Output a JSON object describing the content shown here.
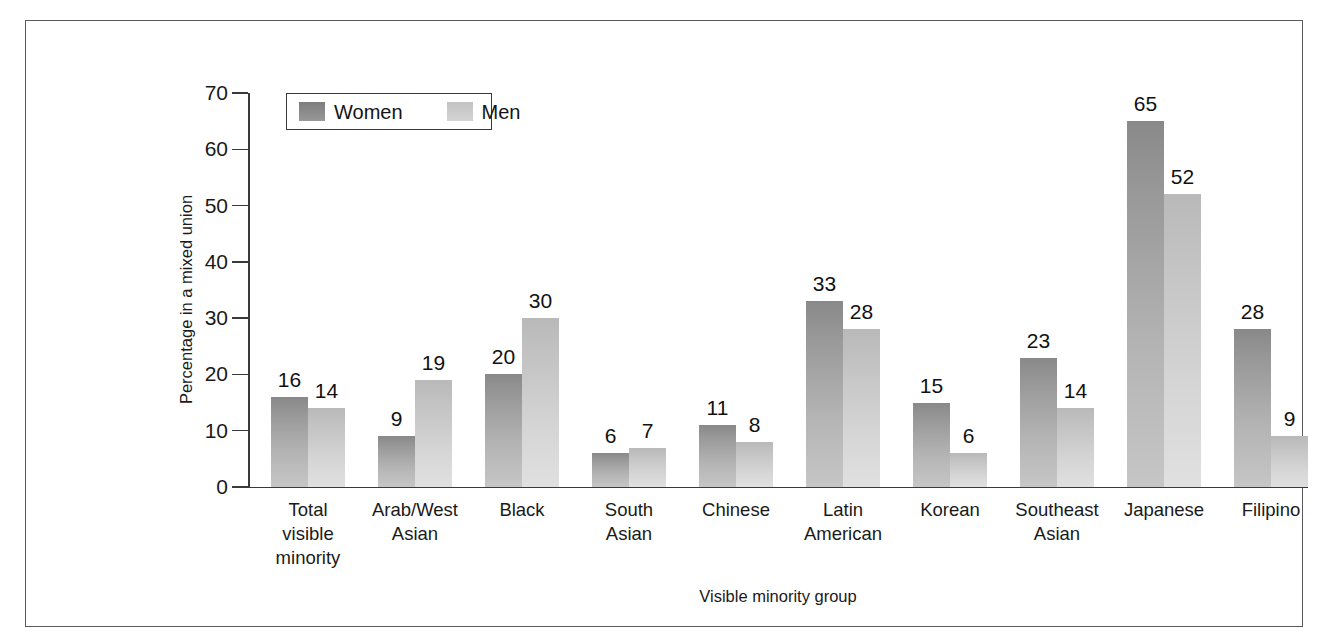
{
  "chart_data": {
    "type": "bar",
    "title": "",
    "subtitle": "",
    "xlabel": "Visible minority group",
    "ylabel": "Percentage in a mixed union",
    "ylim": [
      0,
      70
    ],
    "yticks": [
      0,
      10,
      20,
      30,
      40,
      50,
      60,
      70
    ],
    "grid": false,
    "legend_position": "top-left inside plot",
    "categories": [
      "Total visible minority",
      "Arab/West Asian",
      "Black",
      "South Asian",
      "Chinese",
      "Latin American",
      "Korean",
      "Southeast Asian",
      "Japanese",
      "Filipino"
    ],
    "category_lines": [
      [
        "Total",
        "visible",
        "minority"
      ],
      [
        "Arab/West",
        "Asian"
      ],
      [
        "Black"
      ],
      [
        "South",
        "Asian"
      ],
      [
        "Chinese"
      ],
      [
        "Latin",
        "American"
      ],
      [
        "Korean"
      ],
      [
        "Southeast",
        "Asian"
      ],
      [
        "Japanese"
      ],
      [
        "Filipino"
      ]
    ],
    "series": [
      {
        "name": "Women",
        "color": "#8f8f8f",
        "values": [
          16,
          9,
          20,
          6,
          11,
          33,
          15,
          23,
          65,
          28
        ]
      },
      {
        "name": "Men",
        "color": "#c8c8c8",
        "values": [
          14,
          19,
          30,
          7,
          8,
          28,
          6,
          14,
          52,
          9
        ]
      }
    ]
  },
  "legend": {
    "items": [
      {
        "label": "Women",
        "swatch": "dark-gray-swatch"
      },
      {
        "label": "Men",
        "swatch": "light-gray-swatch"
      }
    ]
  },
  "colors": {
    "frame": "#5a5a5a",
    "axis": "#3a3a3a",
    "text": "#1a1a1a",
    "women_bar": "#8f8f8f",
    "men_bar": "#c8c8c8",
    "background": "#ffffff"
  }
}
